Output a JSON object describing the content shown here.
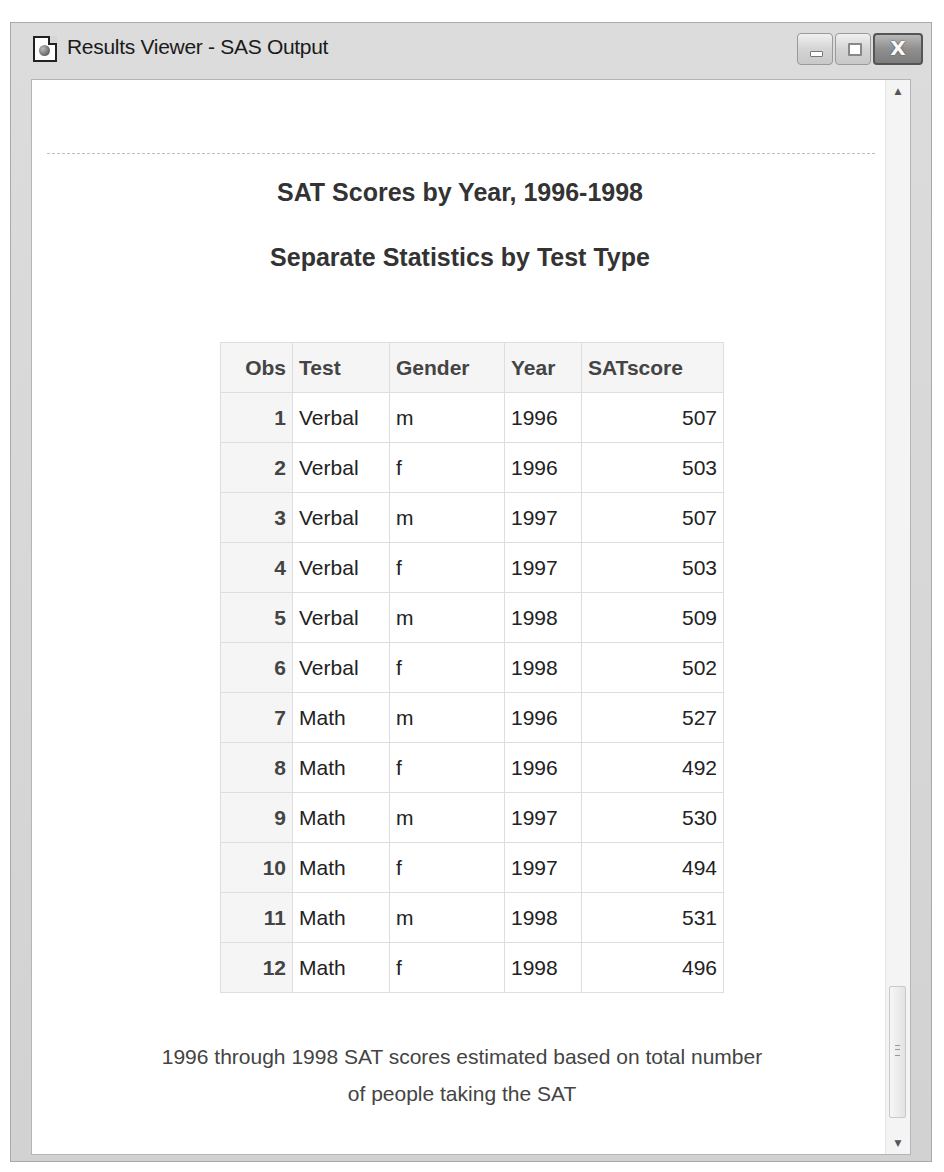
{
  "window": {
    "title": "Results Viewer - SAS Output",
    "icon": "sas-results-icon",
    "buttons": {
      "minimize": "minimize-icon",
      "maximize": "maximize-icon",
      "close_glyph": "X"
    }
  },
  "report": {
    "title": "SAT Scores by Year, 1996-1998",
    "subtitle": "Separate Statistics by Test Type",
    "table": {
      "columns": [
        "Obs",
        "Test",
        "Gender",
        "Year",
        "SATscore"
      ],
      "rows": [
        {
          "obs": "1",
          "test": "Verbal",
          "gender": "m",
          "year": "1996",
          "score": "507"
        },
        {
          "obs": "2",
          "test": "Verbal",
          "gender": "f",
          "year": "1996",
          "score": "503"
        },
        {
          "obs": "3",
          "test": "Verbal",
          "gender": "m",
          "year": "1997",
          "score": "507"
        },
        {
          "obs": "4",
          "test": "Verbal",
          "gender": "f",
          "year": "1997",
          "score": "503"
        },
        {
          "obs": "5",
          "test": "Verbal",
          "gender": "m",
          "year": "1998",
          "score": "509"
        },
        {
          "obs": "6",
          "test": "Verbal",
          "gender": "f",
          "year": "1998",
          "score": "502"
        },
        {
          "obs": "7",
          "test": "Math",
          "gender": "m",
          "year": "1996",
          "score": "527"
        },
        {
          "obs": "8",
          "test": "Math",
          "gender": "f",
          "year": "1996",
          "score": "492"
        },
        {
          "obs": "9",
          "test": "Math",
          "gender": "m",
          "year": "1997",
          "score": "530"
        },
        {
          "obs": "10",
          "test": "Math",
          "gender": "f",
          "year": "1997",
          "score": "494"
        },
        {
          "obs": "11",
          "test": "Math",
          "gender": "m",
          "year": "1998",
          "score": "531"
        },
        {
          "obs": "12",
          "test": "Math",
          "gender": "f",
          "year": "1998",
          "score": "496"
        }
      ]
    },
    "footnote_line1": "1996 through 1998 SAT scores estimated based on total number",
    "footnote_line2": "of people taking the SAT"
  },
  "scrollbar": {
    "up_arrow": "▲",
    "down_arrow": "▼"
  }
}
